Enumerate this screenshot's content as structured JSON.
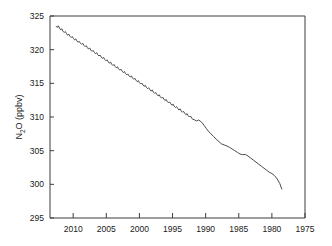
{
  "chart_data": {
    "type": "line",
    "title": "",
    "subtitle": "",
    "xlabel": "",
    "ylabel": "N2O (ppbv)",
    "ylabel_parts": {
      "pre": "N",
      "sub": "2",
      "post": "O (ppbv)"
    },
    "xlim": [
      2013.5,
      1975.0
    ],
    "ylim": [
      295,
      325
    ],
    "x_reversed": true,
    "grid": false,
    "legend": null,
    "annotations": [],
    "x_ticks": [
      2010,
      2005,
      2000,
      1995,
      1990,
      1985,
      1980,
      1975
    ],
    "x_tick_labels": [
      "2010",
      "2005",
      "2000",
      "1995",
      "1990",
      "1985",
      "1980",
      "1975"
    ],
    "y_ticks": [
      295,
      300,
      305,
      310,
      315,
      320,
      325
    ],
    "y_tick_labels": [
      "295",
      "300",
      "305",
      "310",
      "315",
      "320",
      "325"
    ],
    "series": [
      {
        "name": "N2O mixing ratio",
        "color": "#4a4a4a",
        "x": [
          2012.55,
          2012.4,
          2012.25,
          2012.05,
          2011.9,
          2011.7,
          2011.55,
          2011.35,
          2011.2,
          2011.0,
          2010.85,
          2010.65,
          2010.5,
          2010.3,
          2010.15,
          2009.95,
          2009.8,
          2009.6,
          2009.45,
          2009.25,
          2009.1,
          2008.9,
          2008.75,
          2008.55,
          2008.4,
          2008.2,
          2008.05,
          2007.85,
          2007.7,
          2007.5,
          2007.35,
          2007.15,
          2007.0,
          2006.8,
          2006.65,
          2006.45,
          2006.3,
          2006.1,
          2005.95,
          2005.75,
          2005.6,
          2005.4,
          2005.25,
          2005.05,
          2004.9,
          2004.7,
          2004.55,
          2004.35,
          2004.2,
          2004.0,
          2003.85,
          2003.65,
          2003.5,
          2003.3,
          2003.15,
          2002.95,
          2002.8,
          2002.6,
          2002.45,
          2002.25,
          2002.1,
          2001.9,
          2001.75,
          2001.55,
          2001.4,
          2001.2,
          2001.05,
          2000.85,
          2000.7,
          2000.5,
          2000.35,
          2000.15,
          2000.0,
          1999.8,
          1999.65,
          1999.45,
          1999.3,
          1999.1,
          1998.95,
          1998.75,
          1998.6,
          1998.4,
          1998.25,
          1998.05,
          1997.9,
          1997.7,
          1997.55,
          1997.35,
          1997.2,
          1997.0,
          1996.85,
          1996.65,
          1996.5,
          1996.3,
          1996.15,
          1995.95,
          1995.8,
          1995.6,
          1995.45,
          1995.25,
          1995.1,
          1994.9,
          1994.75,
          1994.55,
          1994.4,
          1994.2,
          1994.05,
          1993.85,
          1993.7,
          1993.5,
          1993.35,
          1993.15,
          1993.0,
          1992.8,
          1992.65,
          1992.45,
          1992.3,
          1992.1,
          1991.95,
          1991.7,
          1991.4,
          1991.1,
          1990.8,
          1990.5,
          1990.2,
          1989.9,
          1989.6,
          1989.2,
          1988.8,
          1988.4,
          1988.0,
          1987.6,
          1987.2,
          1986.8,
          1986.4,
          1986.0,
          1985.6,
          1985.2,
          1984.8,
          1984.4,
          1984.0,
          1983.6,
          1983.2,
          1982.8,
          1982.4,
          1982.0,
          1981.6,
          1981.2,
          1980.8,
          1980.4,
          1980.0,
          1979.6,
          1979.2,
          1978.8,
          1978.5
        ],
        "y": [
          323.45,
          323.3,
          323.55,
          323.2,
          322.95,
          323.1,
          322.75,
          322.55,
          322.7,
          322.4,
          322.15,
          322.3,
          322.0,
          321.8,
          321.95,
          321.65,
          321.45,
          321.6,
          321.3,
          321.1,
          321.25,
          320.95,
          320.8,
          320.95,
          320.65,
          320.45,
          320.6,
          320.3,
          320.1,
          320.25,
          319.95,
          319.75,
          319.9,
          319.6,
          319.4,
          319.55,
          319.25,
          319.05,
          319.2,
          318.9,
          318.7,
          318.85,
          318.55,
          318.35,
          318.5,
          318.2,
          318.0,
          318.15,
          317.85,
          317.65,
          317.8,
          317.5,
          317.3,
          317.45,
          317.15,
          316.95,
          317.1,
          316.8,
          316.6,
          316.75,
          316.45,
          316.25,
          316.4,
          316.1,
          315.95,
          316.1,
          315.8,
          315.6,
          315.75,
          315.45,
          315.25,
          315.4,
          315.1,
          314.9,
          315.05,
          314.75,
          314.55,
          314.7,
          314.4,
          314.2,
          314.35,
          314.05,
          313.85,
          314.0,
          313.7,
          313.5,
          313.65,
          313.35,
          313.15,
          313.3,
          313.0,
          312.8,
          312.95,
          312.65,
          312.45,
          312.6,
          312.3,
          312.1,
          312.25,
          311.95,
          311.75,
          311.9,
          311.6,
          311.4,
          311.55,
          311.25,
          311.05,
          311.2,
          310.9,
          310.7,
          310.85,
          310.55,
          310.35,
          310.5,
          310.2,
          310.0,
          310.15,
          309.85,
          309.65,
          309.6,
          309.4,
          309.55,
          309.4,
          309.1,
          308.7,
          308.3,
          307.9,
          307.5,
          307.1,
          306.7,
          306.35,
          306.0,
          305.85,
          305.7,
          305.5,
          305.25,
          305.0,
          304.75,
          304.5,
          304.4,
          304.45,
          304.2,
          303.9,
          303.6,
          303.3,
          303.0,
          302.7,
          302.4,
          302.1,
          301.8,
          301.6,
          301.3,
          300.8,
          300.1,
          299.3
        ]
      }
    ]
  }
}
